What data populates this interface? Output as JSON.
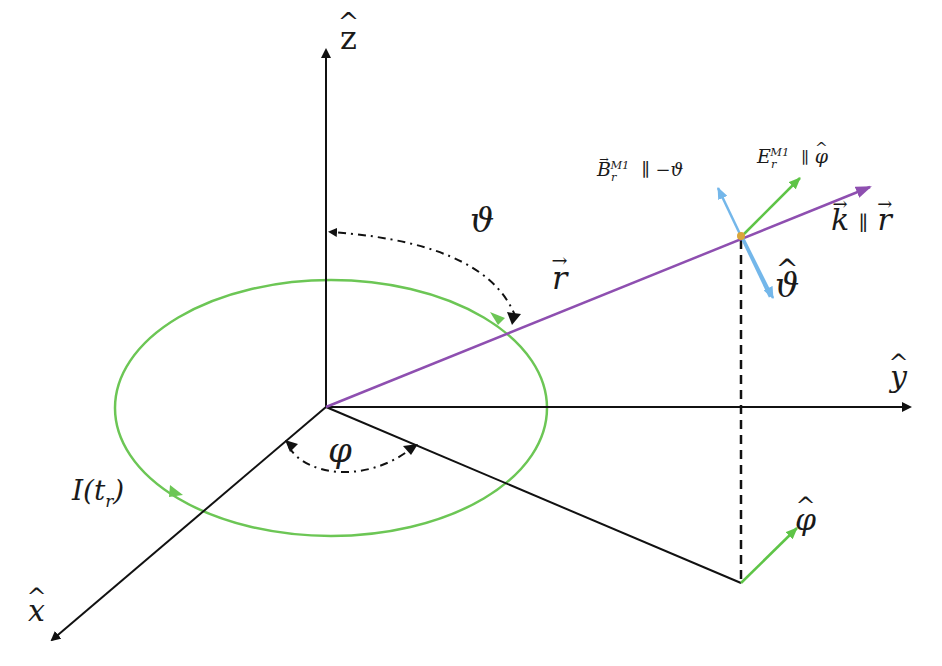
{
  "diagram": {
    "colors": {
      "axes": "#111111",
      "loop": "#6cc655",
      "r_vector": "#8e4fb0",
      "b_field": "#74b7ea",
      "e_field": "#5ec447",
      "point": "#d9a63a"
    },
    "axes": {
      "z_label": "z",
      "y_label": "y",
      "x_label": "x"
    },
    "angles": {
      "theta": "ϑ",
      "phi": "φ"
    },
    "loop": {
      "current_label_I": "I(t",
      "current_sub": "r",
      "current_close": ")"
    },
    "vectors": {
      "r_label": "r",
      "k_label": "k",
      "k_parallel": "∥",
      "k_rhs": "r",
      "b_label": "B",
      "b_sub": "r",
      "b_sup": "M1",
      "b_rel": "∥ −ϑ",
      "e_label": "E",
      "e_sub": "r",
      "e_sup": "M1",
      "e_rel": "∥",
      "e_rhs": "φ",
      "theta_hat_label": "ϑ",
      "phi_hat_label": "φ"
    }
  }
}
